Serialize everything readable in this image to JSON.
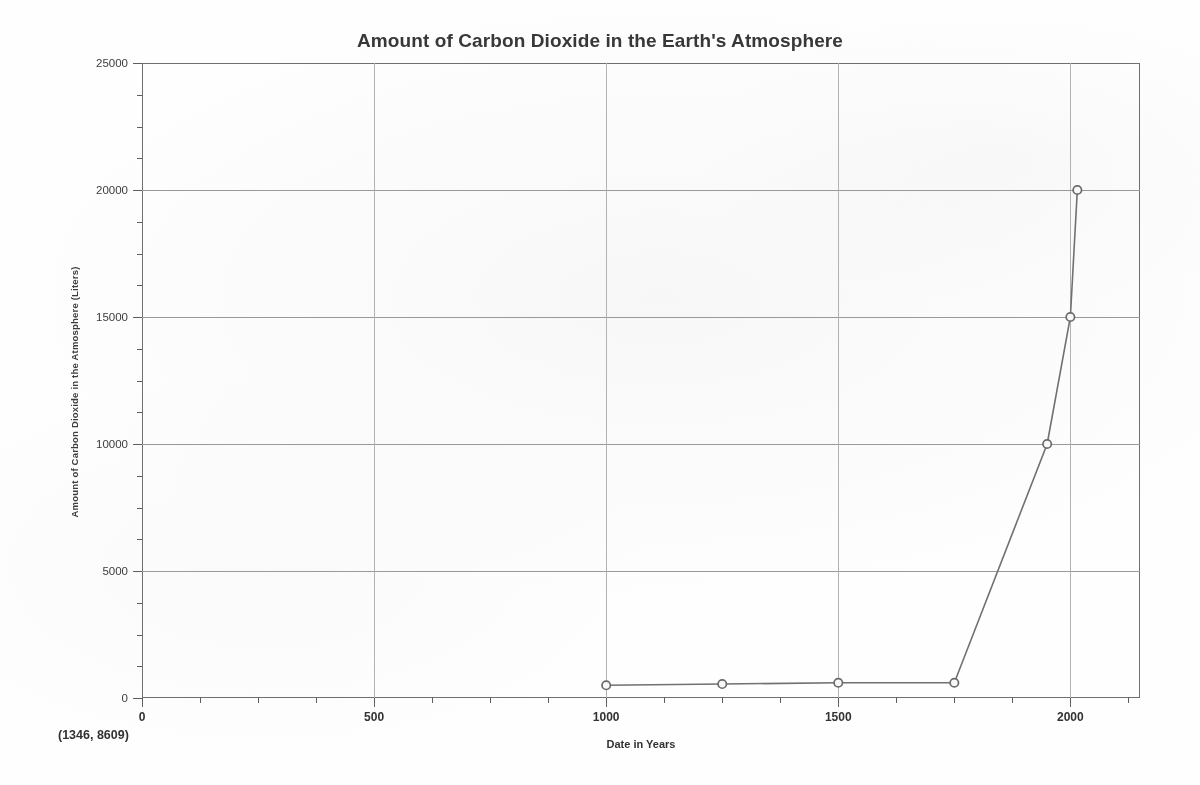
{
  "chart_data": {
    "type": "line",
    "title": "Amount of Carbon Dioxide in the Earth's Atmosphere",
    "xlabel": "Date in Years",
    "ylabel": "Amount of Carbon Dioxide in the Atmosphere (Liters)",
    "xlim": [
      0,
      2150
    ],
    "ylim": [
      0,
      25000
    ],
    "xticks": [
      0,
      500,
      1000,
      1500,
      2000
    ],
    "xtick_labels": [
      "0",
      "500",
      "1000",
      "1500",
      "2000"
    ],
    "yticks": [
      0,
      5000,
      10000,
      15000,
      20000,
      25000
    ],
    "ytick_labels": [
      "0",
      "5000",
      "10000",
      "15000",
      "20000",
      "25000"
    ],
    "x_minor_step": 125,
    "y_minor_step": 1250,
    "grid": true,
    "grid_axes": "both",
    "legend": "none",
    "marker": "open-circle",
    "series": [
      {
        "name": "Carbon Dioxide",
        "x": [
          1000,
          1250,
          1500,
          1750,
          1950,
          2000,
          2015
        ],
        "values": [
          500,
          550,
          600,
          600,
          10000,
          15000,
          20000
        ]
      }
    ]
  },
  "chart": {
    "title": "Amount of Carbon Dioxide in the Earth's Atmosphere",
    "y_axis_title": "Amount of Carbon Dioxide in the Atmosphere (Liters)",
    "x_axis_title": "Date in Years",
    "coordinate_readout": "(1346, 8609)",
    "line_color": "#707070",
    "marker_color": "#6a6a6a",
    "grid_color": "#9a9a9a",
    "frame_color": "#6e6e6e"
  }
}
